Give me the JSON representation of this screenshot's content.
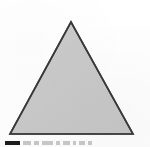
{
  "figure": {
    "kind": "geometric-shape-illustration",
    "shape_name": "triangle",
    "medium": "scanned printed page",
    "background_color": "#fefefe",
    "alt_text": "Gray shaded triangle with dark outline",
    "shape": {
      "type": "triangle",
      "classification": "equilateral",
      "fill_color": "#c9c9c9",
      "stroke_color": "#3a3a3a",
      "stroke_width": 1.6,
      "vertices": [
        {
          "name": "apex",
          "x": 71,
          "y": 22
        },
        {
          "name": "bottom-left",
          "x": 10,
          "y": 134
        },
        {
          "name": "bottom-right",
          "x": 133,
          "y": 134
        }
      ],
      "base_width": 123,
      "height": 112
    }
  },
  "caption": {
    "visible": "partial",
    "note": "Only the topmost pixel row of the caption line is visible; text is cut off and illegible.",
    "swatch_color": "#1c1c1c",
    "fragment_color": "#9a9a9a",
    "fragments": [
      "",
      "",
      "",
      "",
      "",
      "",
      "",
      ""
    ]
  }
}
